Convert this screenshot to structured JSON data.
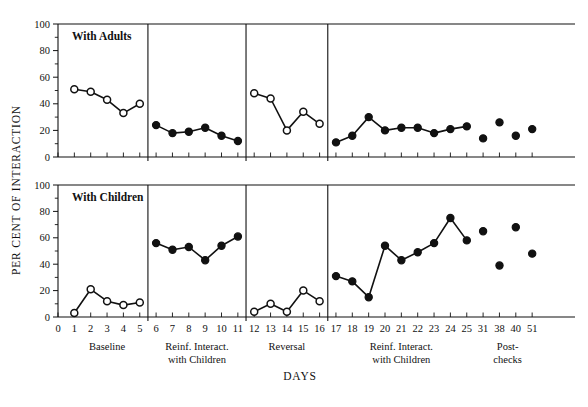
{
  "chart_data": {
    "type": "line",
    "title": "",
    "xlabel": "DAYS",
    "ylabel": "PER CENT OF INTERACTION",
    "ylim": [
      0,
      100
    ],
    "yticks": [
      0,
      20,
      40,
      60,
      80,
      100
    ],
    "yticks_minor": [
      10,
      30,
      50,
      70,
      90
    ],
    "grid": false,
    "legend": "none",
    "x_tick_labels": [
      "0",
      "1",
      "2",
      "3",
      "4",
      "5",
      "6",
      "7",
      "8",
      "9",
      "10",
      "11",
      "12",
      "13",
      "14",
      "15",
      "16",
      "17",
      "18",
      "19",
      "20",
      "21",
      "22",
      "23",
      "24",
      "25",
      "31",
      "38",
      "40",
      "51"
    ],
    "phases": [
      {
        "label": "Baseline",
        "label_line2": "",
        "days": [
          1,
          2,
          3,
          4,
          5
        ]
      },
      {
        "label": "Reinf. Interact.",
        "label_line2": "with Children",
        "days": [
          6,
          7,
          8,
          9,
          10,
          11
        ]
      },
      {
        "label": "Reversal",
        "label_line2": "",
        "days": [
          12,
          13,
          14,
          15,
          16
        ]
      },
      {
        "label": "Reinf. Interact.",
        "label_line2": "with Children",
        "days": [
          17,
          18,
          19,
          20,
          21,
          22,
          23,
          24,
          25
        ]
      },
      {
        "label": "Post-",
        "label_line2": "checks",
        "days": [
          31,
          38,
          40,
          51
        ]
      }
    ],
    "panels": [
      {
        "name": "With Adults",
        "segments": [
          {
            "phase": "Baseline",
            "marker": "open",
            "connected": true,
            "x": [
              1,
              2,
              3,
              4,
              5
            ],
            "y": [
              51,
              49,
              43,
              33,
              40
            ]
          },
          {
            "phase": "Reinf. Interact. with Children",
            "marker": "closed",
            "connected": true,
            "x": [
              6,
              7,
              8,
              9,
              10,
              11
            ],
            "y": [
              24,
              18,
              19,
              22,
              16,
              12
            ]
          },
          {
            "phase": "Reversal",
            "marker": "open",
            "connected": true,
            "x": [
              12,
              13,
              14,
              15,
              16
            ],
            "y": [
              48,
              44,
              20,
              34,
              25
            ]
          },
          {
            "phase": "Reinf. Interact. with Children",
            "marker": "closed",
            "connected": true,
            "x": [
              17,
              18,
              19,
              20,
              21,
              22,
              23,
              24,
              25
            ],
            "y": [
              11,
              16,
              30,
              20,
              22,
              22,
              18,
              21,
              23
            ]
          },
          {
            "phase": "Post-checks",
            "marker": "closed",
            "connected": false,
            "x": [
              31,
              38,
              40,
              51
            ],
            "y": [
              14,
              26,
              16,
              21
            ]
          }
        ]
      },
      {
        "name": "With Children",
        "segments": [
          {
            "phase": "Baseline",
            "marker": "open",
            "connected": true,
            "x": [
              1,
              2,
              3,
              4,
              5
            ],
            "y": [
              3,
              21,
              12,
              9,
              11
            ]
          },
          {
            "phase": "Reinf. Interact. with Children",
            "marker": "closed",
            "connected": true,
            "x": [
              6,
              7,
              8,
              9,
              10,
              11
            ],
            "y": [
              56,
              51,
              53,
              43,
              54,
              61
            ]
          },
          {
            "phase": "Reversal",
            "marker": "open",
            "connected": true,
            "x": [
              12,
              13,
              14,
              15,
              16
            ],
            "y": [
              4,
              10,
              4,
              20,
              12
            ]
          },
          {
            "phase": "Reinf. Interact. with Children",
            "marker": "closed",
            "connected": true,
            "x": [
              17,
              18,
              19,
              20,
              21,
              22,
              23,
              24,
              25
            ],
            "y": [
              31,
              27,
              15,
              54,
              43,
              49,
              56,
              75,
              58
            ]
          },
          {
            "phase": "Post-checks",
            "marker": "closed",
            "connected": false,
            "x": [
              31,
              38,
              40,
              51
            ],
            "y": [
              65,
              39,
              68,
              48
            ]
          }
        ]
      }
    ]
  }
}
